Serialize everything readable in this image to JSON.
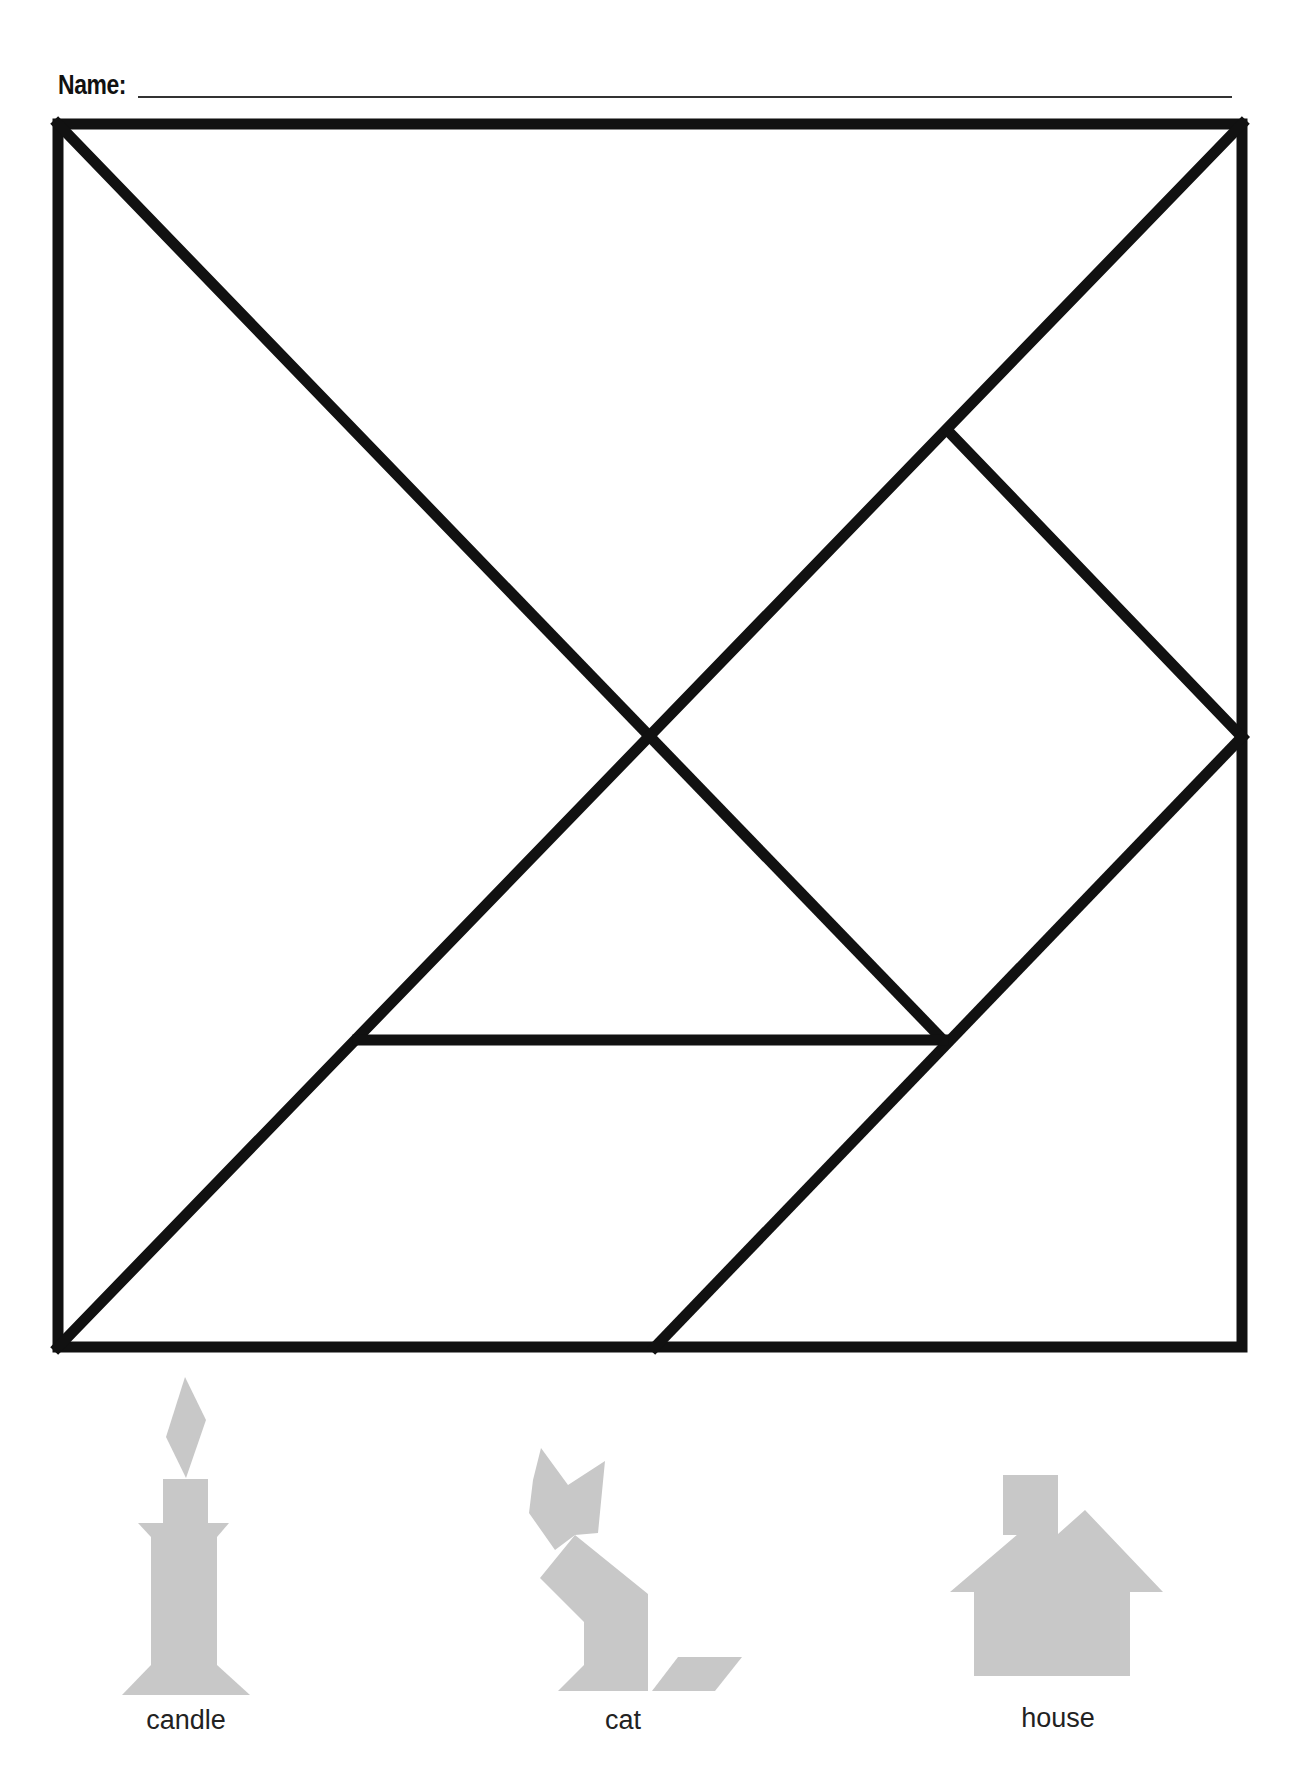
{
  "worksheet": {
    "name_label": "Name:",
    "name_field_value": ""
  },
  "tangram": {
    "border_color": "#111111",
    "pieces": [
      {
        "id": "large-triangle-left",
        "shape": "triangle"
      },
      {
        "id": "large-triangle-top",
        "shape": "triangle"
      },
      {
        "id": "small-triangle-top-right",
        "shape": "triangle"
      },
      {
        "id": "square",
        "shape": "square"
      },
      {
        "id": "small-triangle-center",
        "shape": "triangle"
      },
      {
        "id": "parallelogram",
        "shape": "parallelogram"
      },
      {
        "id": "medium-triangle-bottom-right",
        "shape": "triangle"
      }
    ]
  },
  "examples": {
    "fill_color": "#c8c8c8",
    "items": [
      {
        "label": "candle"
      },
      {
        "label": "cat"
      },
      {
        "label": "house"
      }
    ]
  }
}
